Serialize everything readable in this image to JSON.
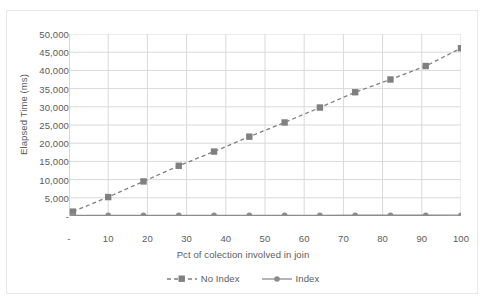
{
  "chart_data": {
    "type": "line",
    "title": "",
    "xlabel": "Pct of colection involved in join",
    "ylabel": "Elapsed Time (ms)",
    "xlim": [
      0,
      100
    ],
    "ylim": [
      0,
      50000
    ],
    "grid": true,
    "legend_position": "bottom",
    "x_tick_labels": [
      "-",
      "10",
      "20",
      "30",
      "40",
      "50",
      "60",
      "70",
      "80",
      "90",
      "100"
    ],
    "x_tick_values": [
      0,
      10,
      20,
      30,
      40,
      50,
      60,
      70,
      80,
      90,
      100
    ],
    "y_tick_labels": [
      "-",
      "5,000",
      "10,000",
      "15,000",
      "20,000",
      "25,000",
      "30,000",
      "35,000",
      "40,000",
      "45,000",
      "50,000"
    ],
    "y_tick_values": [
      0,
      5000,
      10000,
      15000,
      20000,
      25000,
      30000,
      35000,
      40000,
      45000,
      50000
    ],
    "x": [
      1,
      10,
      19,
      28,
      37,
      46,
      55,
      64,
      73,
      82,
      91,
      100
    ],
    "series": [
      {
        "name": "No Index",
        "marker": "square",
        "line_style": "dashed",
        "color": "#808080",
        "values": [
          1200,
          5200,
          9500,
          13800,
          17700,
          21800,
          25700,
          29800,
          34000,
          37500,
          41200,
          46100
        ]
      },
      {
        "name": "Index",
        "marker": "circle",
        "line_style": "solid",
        "color": "#8c8c8c",
        "values": [
          150,
          160,
          170,
          175,
          180,
          185,
          190,
          195,
          200,
          205,
          210,
          215
        ]
      }
    ]
  },
  "style": {
    "grid_color": "#d9d9d9",
    "axis_color": "#bfbfbf",
    "text_color": "#5b5b5b",
    "plot_background": "#ffffff",
    "frame_border": "#e8e8e8"
  }
}
